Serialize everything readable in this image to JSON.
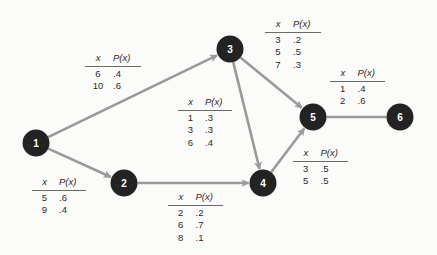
{
  "diagram": {
    "colors": {
      "node_fill": "#232323",
      "node_text": "#ffffff",
      "edge": "#9a9a9a",
      "background": "#fbfbf9"
    },
    "nodes": [
      {
        "id": "1",
        "label": "1",
        "x": 36,
        "y": 143
      },
      {
        "id": "2",
        "label": "2",
        "x": 124,
        "y": 183
      },
      {
        "id": "3",
        "label": "3",
        "x": 230,
        "y": 49
      },
      {
        "id": "4",
        "label": "4",
        "x": 263,
        "y": 183
      },
      {
        "id": "5",
        "label": "5",
        "x": 313,
        "y": 117
      },
      {
        "id": "6",
        "label": "6",
        "x": 400,
        "y": 117
      }
    ],
    "edges": [
      {
        "from": "1",
        "to": "3",
        "arrow": true
      },
      {
        "from": "1",
        "to": "2",
        "arrow": true
      },
      {
        "from": "2",
        "to": "4",
        "arrow": true
      },
      {
        "from": "3",
        "to": "4",
        "arrow": true
      },
      {
        "from": "3",
        "to": "5",
        "arrow": true
      },
      {
        "from": "4",
        "to": "5",
        "arrow": true
      },
      {
        "from": "5",
        "to": "6",
        "arrow": false
      }
    ],
    "tables": [
      {
        "edge": "1-3",
        "header": [
          "x",
          "P(x)"
        ],
        "rows": [
          [
            "6",
            ".4"
          ],
          [
            "10",
            ".6"
          ]
        ]
      },
      {
        "edge": "3-5",
        "header": [
          "x",
          "P(x)"
        ],
        "rows": [
          [
            "3",
            ".2"
          ],
          [
            "5",
            ".5"
          ],
          [
            "7",
            ".3"
          ]
        ]
      },
      {
        "edge": "3-4",
        "header": [
          "x",
          "P(x)"
        ],
        "rows": [
          [
            "1",
            ".3"
          ],
          [
            "3",
            ".3"
          ],
          [
            "6",
            ".4"
          ]
        ]
      },
      {
        "edge": "5-6",
        "header": [
          "x",
          "P(x)"
        ],
        "rows": [
          [
            "1",
            ".4"
          ],
          [
            "2",
            ".6"
          ]
        ]
      },
      {
        "edge": "4-5",
        "header": [
          "x",
          "P(x)"
        ],
        "rows": [
          [
            "3",
            ".5"
          ],
          [
            "5",
            ".5"
          ]
        ]
      },
      {
        "edge": "1-2",
        "header": [
          "x",
          "P(x)"
        ],
        "rows": [
          [
            "5",
            ".6"
          ],
          [
            "9",
            ".4"
          ]
        ]
      },
      {
        "edge": "2-4",
        "header": [
          "x",
          "P(x)"
        ],
        "rows": [
          [
            "2",
            ".2"
          ],
          [
            "6",
            ".7"
          ],
          [
            "8",
            ".1"
          ]
        ]
      }
    ]
  }
}
